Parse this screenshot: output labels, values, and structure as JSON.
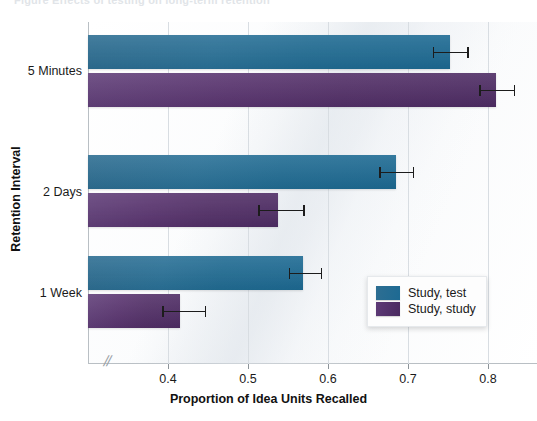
{
  "caption": "Figure   Effects of testing on long-term retention",
  "chart_data": {
    "type": "bar",
    "orientation": "horizontal",
    "title": "",
    "xlabel": "Proportion of Idea Units Recalled",
    "ylabel": "Retention Interval",
    "categories": [
      "5 Minutes",
      "2 Days",
      "1 Week"
    ],
    "xticks": [
      0.4,
      0.5,
      0.6,
      0.7,
      0.8
    ],
    "xtick_labels": [
      "0.4",
      "0.5",
      "0.6",
      "0.7",
      "0.8"
    ],
    "xlim": [
      0.36,
      0.84
    ],
    "axis_break": "//",
    "grid": true,
    "legend_position": "inside-lower-right",
    "series": [
      {
        "name": "Study, test",
        "color": "#23708f",
        "values": [
          0.753,
          0.685,
          0.569
        ],
        "err_low": [
          0.731,
          0.664,
          0.551
        ],
        "err_high": [
          0.776,
          0.708,
          0.593
        ]
      },
      {
        "name": "Study, study",
        "color": "#52306a",
        "values": [
          0.81,
          0.538,
          0.415
        ],
        "err_low": [
          0.789,
          0.513,
          0.393
        ],
        "err_high": [
          0.834,
          0.571,
          0.448
        ]
      }
    ]
  }
}
